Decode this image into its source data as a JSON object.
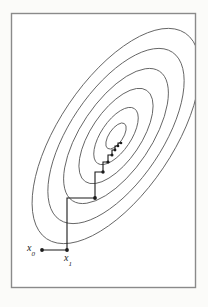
{
  "figure": {
    "kind": "contour-plot-with-zigzag-path",
    "background_color": "#fbfbf9",
    "frame": {
      "stroke_color": "#8a8a8a",
      "fill_color": "#ffffff",
      "x": 11,
      "y": 13,
      "width": 185,
      "height": 275
    },
    "contours": {
      "stroke_color": "#5c5c5c",
      "count": 6,
      "center_x": 116,
      "center_y": 136,
      "rotation_deg": -56,
      "ellipses": [
        {
          "rx": 124,
          "ry": 57
        },
        {
          "rx": 101,
          "ry": 46
        },
        {
          "rx": 78,
          "ry": 35
        },
        {
          "rx": 55,
          "ry": 25
        },
        {
          "rx": 33,
          "ry": 15
        },
        {
          "rx": 15,
          "ry": 7
        }
      ]
    },
    "path": {
      "stroke_color": "#1b1b1b",
      "marker_color": "#1b1b1b",
      "marker_radius": 1.9,
      "points": [
        {
          "x": 42,
          "y": 250,
          "marker": true
        },
        {
          "x": 67,
          "y": 250,
          "marker": true
        },
        {
          "x": 67,
          "y": 198,
          "marker": false
        },
        {
          "x": 95,
          "y": 198,
          "marker": true
        },
        {
          "x": 95,
          "y": 172,
          "marker": false
        },
        {
          "x": 103,
          "y": 172,
          "marker": true
        },
        {
          "x": 103,
          "y": 162,
          "marker": false
        },
        {
          "x": 108,
          "y": 162,
          "marker": true
        },
        {
          "x": 108,
          "y": 155,
          "marker": false
        },
        {
          "x": 112,
          "y": 155,
          "marker": true
        },
        {
          "x": 112,
          "y": 150,
          "marker": false
        },
        {
          "x": 115,
          "y": 150,
          "marker": true
        },
        {
          "x": 115,
          "y": 146,
          "marker": false
        },
        {
          "x": 118,
          "y": 146,
          "marker": true
        },
        {
          "x": 118,
          "y": 143,
          "marker": false
        },
        {
          "x": 121,
          "y": 143,
          "marker": true
        }
      ]
    },
    "labels": {
      "x0": {
        "base": "x",
        "sub": "0"
      },
      "x1": {
        "base": "x",
        "sub": "1"
      }
    }
  }
}
